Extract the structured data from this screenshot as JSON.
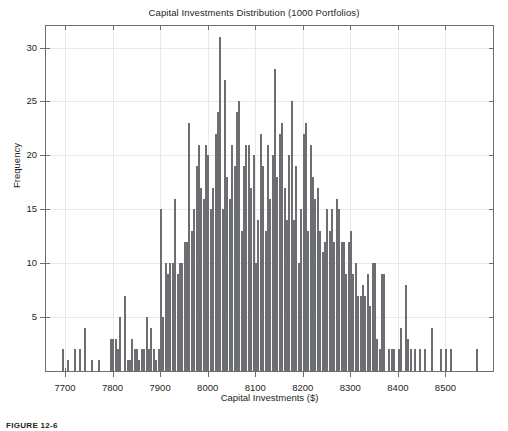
{
  "chart_data": {
    "type": "bar",
    "title": "Capital Investments Distribution (1000 Portfolios)",
    "xlabel": "Capital Investments ($)",
    "ylabel": "Frequency",
    "xlim": [
      7660,
      8600
    ],
    "ylim": [
      0,
      32
    ],
    "grid": true,
    "legend": null,
    "bin_width": 5,
    "xticks": [
      7700,
      7800,
      7900,
      8000,
      8100,
      8200,
      8300,
      8400,
      8500
    ],
    "yticks": [
      5,
      10,
      15,
      20,
      25,
      30
    ],
    "bin_centers": [
      7672,
      7677,
      7682,
      7687,
      7692,
      7697,
      7702,
      7707,
      7712,
      7717,
      7722,
      7727,
      7732,
      7737,
      7742,
      7747,
      7752,
      7757,
      7762,
      7767,
      7772,
      7777,
      7782,
      7787,
      7792,
      7797,
      7802,
      7807,
      7812,
      7817,
      7822,
      7827,
      7832,
      7837,
      7842,
      7847,
      7852,
      7857,
      7862,
      7867,
      7872,
      7877,
      7882,
      7887,
      7892,
      7897,
      7902,
      7907,
      7912,
      7917,
      7922,
      7927,
      7932,
      7937,
      7942,
      7947,
      7952,
      7957,
      7962,
      7967,
      7972,
      7977,
      7982,
      7987,
      7992,
      7997,
      8002,
      8007,
      8012,
      8017,
      8022,
      8027,
      8032,
      8037,
      8042,
      8047,
      8052,
      8057,
      8062,
      8067,
      8072,
      8077,
      8082,
      8087,
      8092,
      8097,
      8102,
      8107,
      8112,
      8117,
      8122,
      8127,
      8132,
      8137,
      8142,
      8147,
      8152,
      8157,
      8162,
      8167,
      8172,
      8177,
      8182,
      8187,
      8192,
      8197,
      8202,
      8207,
      8212,
      8217,
      8222,
      8227,
      8232,
      8237,
      8242,
      8247,
      8252,
      8257,
      8262,
      8267,
      8272,
      8277,
      8282,
      8287,
      8292,
      8297,
      8302,
      8307,
      8312,
      8317,
      8322,
      8327,
      8332,
      8337,
      8342,
      8347,
      8352,
      8357,
      8362,
      8367,
      8372,
      8377,
      8382,
      8387,
      8392,
      8397,
      8402,
      8407,
      8412,
      8417,
      8422,
      8427,
      8432,
      8437,
      8442,
      8447,
      8452,
      8457,
      8462,
      8467,
      8472,
      8477,
      8482,
      8487,
      8492,
      8497,
      8502,
      8507,
      8512,
      8517,
      8522,
      8527,
      8532,
      8537,
      8542,
      8547,
      8552,
      8557,
      8562,
      8567,
      8572,
      8577
    ],
    "values": [
      0,
      0,
      0,
      0,
      0,
      2,
      0,
      1,
      0,
      0,
      2,
      0,
      2,
      0,
      4,
      0,
      0,
      1,
      0,
      0,
      1,
      0,
      0,
      0,
      0,
      3,
      3,
      3,
      2,
      5,
      0,
      7,
      1,
      1,
      3,
      2,
      2,
      1,
      2,
      2,
      5,
      2,
      4,
      2,
      1,
      2,
      15,
      5,
      10,
      9,
      10,
      10,
      16,
      9,
      10,
      10,
      12,
      12,
      23,
      13,
      15,
      19,
      21,
      17,
      16,
      21,
      20,
      15,
      17,
      22,
      24,
      31,
      15,
      27,
      18,
      16,
      21,
      19,
      24,
      25,
      13,
      19,
      21,
      21,
      17,
      20,
      10,
      14,
      22,
      19,
      13,
      21,
      16,
      20,
      28,
      18,
      22,
      23,
      17,
      14,
      20,
      25,
      14,
      19,
      10,
      15,
      22,
      23,
      13,
      21,
      18,
      16,
      17,
      13,
      11,
      12,
      15,
      13,
      15,
      12,
      16,
      15,
      12,
      12,
      9,
      12,
      13,
      9,
      10,
      7,
      7,
      8,
      7,
      9,
      6,
      10,
      10,
      3,
      2,
      9,
      9,
      0,
      2,
      2,
      2,
      0,
      2,
      4,
      0,
      8,
      3,
      2,
      0,
      2,
      0,
      2,
      0,
      2,
      0,
      0,
      4,
      0,
      0,
      0,
      2,
      0,
      2,
      0,
      2,
      0,
      0,
      0,
      0,
      0,
      0,
      0,
      0,
      0,
      0,
      2,
      0,
      0
    ]
  },
  "caption": {
    "figure_label": "FIGURE 12-6"
  }
}
